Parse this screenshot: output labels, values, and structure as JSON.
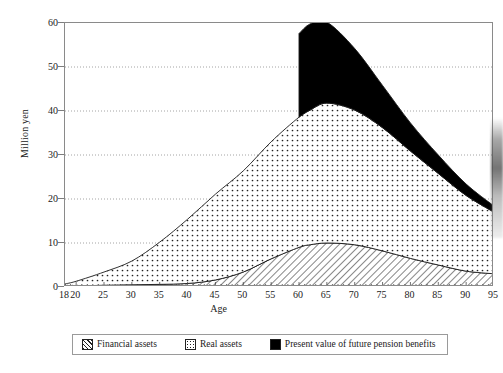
{
  "chart_data": {
    "type": "area",
    "title": "",
    "xlabel": "Age",
    "ylabel": "Million yen",
    "xlim": [
      18,
      95
    ],
    "ylim": [
      0,
      60
    ],
    "ytick_values": [
      0,
      10,
      20,
      30,
      40,
      50,
      60
    ],
    "ytick_labels": [
      "0",
      "10",
      "20",
      "30",
      "40",
      "50",
      "60"
    ],
    "xtick_values": [
      18,
      20,
      25,
      30,
      35,
      40,
      45,
      50,
      55,
      60,
      65,
      70,
      75,
      80,
      85,
      90,
      95
    ],
    "xtick_labels": [
      "18",
      "20",
      "25",
      "30",
      "35",
      "40",
      "45",
      "50",
      "55",
      "60",
      "65",
      "70",
      "75",
      "80",
      "85",
      "90",
      "95"
    ],
    "grid": "horizontal-dotted",
    "stacked": true,
    "legend_position": "below-plot",
    "x": [
      18,
      20,
      25,
      30,
      35,
      40,
      45,
      50,
      55,
      60,
      62,
      65,
      70,
      75,
      80,
      85,
      90,
      95
    ],
    "series": [
      {
        "name": "Financial assets",
        "pattern": "hatch",
        "color": "#000000",
        "values": [
          0.1,
          0.2,
          0.4,
          0.5,
          0.6,
          0.8,
          1.6,
          3.4,
          6.4,
          9.0,
          9.6,
          10.0,
          9.6,
          8.2,
          6.5,
          5.0,
          3.6,
          3.0
        ]
      },
      {
        "name": "Real assets",
        "pattern": "dots",
        "color": "#000000",
        "values": [
          0.6,
          1.1,
          3.0,
          5.4,
          9.6,
          14.6,
          19.5,
          23.0,
          26.6,
          29.6,
          30.6,
          31.8,
          30.6,
          28.0,
          24.4,
          20.8,
          17.2,
          14.0
        ]
      },
      {
        "name": "Present value of future pension benefits",
        "pattern": "solid",
        "color": "#000000",
        "values": [
          0,
          0,
          0,
          0,
          0,
          0,
          0,
          0,
          0,
          19.0,
          19.6,
          18.4,
          14.0,
          9.6,
          6.4,
          4.2,
          2.6,
          1.4
        ]
      }
    ],
    "annotations": {
      "note": "Pension benefit area appears abruptly at age 60, peaking near 51 million yen total, then tapering to ~15 at age 95."
    }
  },
  "legend": {
    "items": [
      {
        "label": "Financial assets",
        "swatch": "hatch"
      },
      {
        "label": "Real assets",
        "swatch": "dots"
      },
      {
        "label": "Present value of future pension benefits",
        "swatch": "solid"
      }
    ]
  },
  "axes": {
    "y_title": "Million yen",
    "x_title": "Age"
  }
}
